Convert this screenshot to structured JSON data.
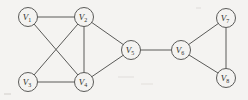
{
  "figure": {
    "name": "undirected-graph-diagram",
    "background_color": "#f4f3f1",
    "stroke_color": "#5a5a58",
    "label_color": "#2e2e2d",
    "width": 248,
    "height": 100
  },
  "chart_data": {
    "type": "diagram",
    "graph_type": "undirected-graph",
    "title": "",
    "node_radius": 9.5,
    "nodes": [
      {
        "id": "V1",
        "label": "V",
        "sub": "1",
        "x": 28,
        "y": 17
      },
      {
        "id": "V2",
        "label": "V",
        "sub": "2",
        "x": 84,
        "y": 17
      },
      {
        "id": "V3",
        "label": "V",
        "sub": "3",
        "x": 28,
        "y": 82
      },
      {
        "id": "V4",
        "label": "V",
        "sub": "4",
        "x": 84,
        "y": 82
      },
      {
        "id": "V5",
        "label": "V",
        "sub": "5",
        "x": 131,
        "y": 50
      },
      {
        "id": "V6",
        "label": "V",
        "sub": "6",
        "x": 181,
        "y": 50
      },
      {
        "id": "V7",
        "label": "V",
        "sub": "7",
        "x": 226,
        "y": 18
      },
      {
        "id": "V8",
        "label": "V",
        "sub": "8",
        "x": 226,
        "y": 78
      }
    ],
    "edges": [
      {
        "from": "V1",
        "to": "V2"
      },
      {
        "from": "V1",
        "to": "V4"
      },
      {
        "from": "V2",
        "to": "V3"
      },
      {
        "from": "V2",
        "to": "V4"
      },
      {
        "from": "V2",
        "to": "V5"
      },
      {
        "from": "V3",
        "to": "V4"
      },
      {
        "from": "V4",
        "to": "V5"
      },
      {
        "from": "V5",
        "to": "V6"
      },
      {
        "from": "V6",
        "to": "V7"
      },
      {
        "from": "V6",
        "to": "V8"
      },
      {
        "from": "V7",
        "to": "V8"
      }
    ],
    "node_count": 8,
    "edge_count": 11
  }
}
